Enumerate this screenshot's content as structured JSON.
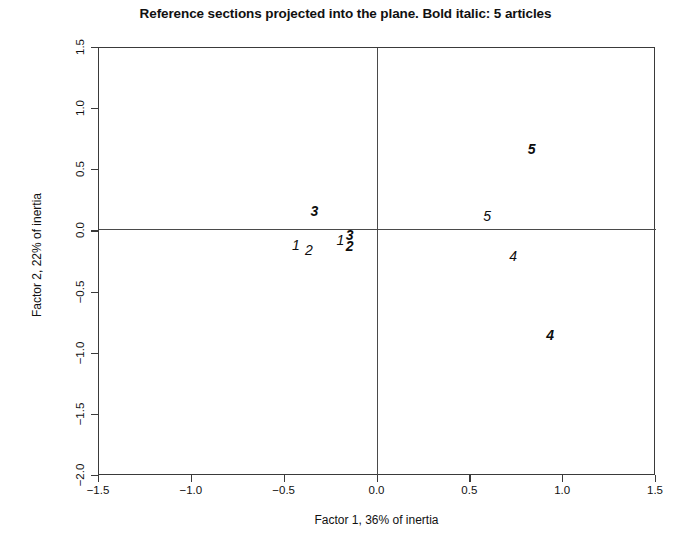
{
  "chart_data": {
    "type": "scatter",
    "title": "Reference sections projected into the plane. Bold italic: 5 articles",
    "xlabel": "Factor 1, 36% of inertia",
    "ylabel": "Factor 2, 22% of inertia",
    "xlim": [
      -1.5,
      1.5
    ],
    "ylim": [
      -2.0,
      1.5
    ],
    "xticks": [
      "-1.5",
      "-1.0",
      "-0.5",
      "0.0",
      "0.5",
      "1.0",
      "1.5"
    ],
    "xtick_values": [
      -1.5,
      -1.0,
      -0.5,
      0.0,
      0.5,
      1.0,
      1.5
    ],
    "yticks": [
      "-2.0",
      "-1.5",
      "-1.0",
      "-0.5",
      "0.0",
      "0.5",
      "1.0",
      "1.5"
    ],
    "ytick_values": [
      -2.0,
      -1.5,
      -1.0,
      -0.5,
      0.0,
      0.5,
      1.0,
      1.5
    ],
    "grid": false,
    "legend": "none",
    "legend_note": "Bold italic: 5 articles",
    "reference_lines": [
      {
        "axis": "horizontal",
        "value": 0.0
      },
      {
        "axis": "vertical",
        "value": 0.0
      }
    ],
    "point_label_styles": {
      "plain": "normal italic — other sections",
      "bold": "bold italic — 5 articles"
    },
    "points": [
      {
        "label": "3",
        "x": -0.34,
        "y": 0.17,
        "style": "bold"
      },
      {
        "label": "1",
        "x": -0.44,
        "y": -0.11,
        "style": "plain"
      },
      {
        "label": "2",
        "x": -0.37,
        "y": -0.15,
        "style": "plain"
      },
      {
        "label": "1",
        "x": -0.2,
        "y": -0.07,
        "style": "plain"
      },
      {
        "label": "3",
        "x": -0.15,
        "y": -0.03,
        "style": "bold"
      },
      {
        "label": "2",
        "x": -0.15,
        "y": -0.12,
        "style": "bold"
      },
      {
        "label": "5",
        "x": 0.83,
        "y": 0.67,
        "style": "bold"
      },
      {
        "label": "5",
        "x": 0.59,
        "y": 0.13,
        "style": "plain"
      },
      {
        "label": "4",
        "x": 0.73,
        "y": -0.2,
        "style": "plain"
      },
      {
        "label": "4",
        "x": 0.93,
        "y": -0.85,
        "style": "bold"
      }
    ]
  }
}
